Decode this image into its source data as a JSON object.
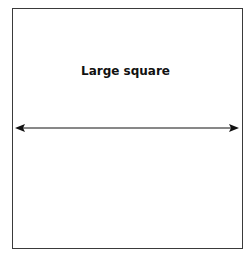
{
  "diagram": {
    "shape_label": "Large square",
    "stroke_color": "#3a3a3a",
    "arrow_color": "#111111",
    "arrow": {
      "type": "double-headed",
      "orientation": "horizontal"
    }
  }
}
